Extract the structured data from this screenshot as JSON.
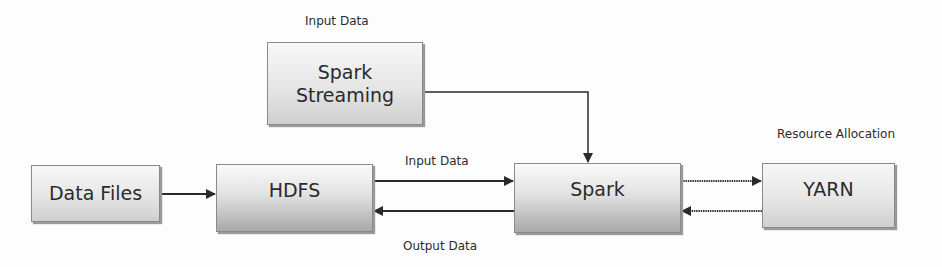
{
  "diagram": {
    "nodes": {
      "spark_streaming": {
        "label": "Spark Streaming",
        "line1": "Spark",
        "line2": "Streaming"
      },
      "data_files": {
        "label": "Data Files"
      },
      "hdfs": {
        "label": "HDFS"
      },
      "spark": {
        "label": "Spark"
      },
      "yarn": {
        "label": "YARN"
      }
    },
    "labels": {
      "streaming_input": "Input Data",
      "hdfs_to_spark": "Input Data",
      "spark_to_hdfs": "Output Data",
      "yarn": "Resource Allocation"
    },
    "edges": [
      {
        "from": "Data Files",
        "to": "HDFS"
      },
      {
        "from": "HDFS",
        "to": "Spark",
        "label": "Input Data"
      },
      {
        "from": "Spark",
        "to": "HDFS",
        "label": "Output Data"
      },
      {
        "from": "Spark Streaming",
        "to": "Spark"
      },
      {
        "from": "Spark",
        "to": "YARN"
      },
      {
        "from": "YARN",
        "to": "Spark"
      }
    ],
    "colors": {
      "line": "#2a2a2a",
      "box_border": "#8a8a8a",
      "text": "#2b2b2b"
    }
  }
}
